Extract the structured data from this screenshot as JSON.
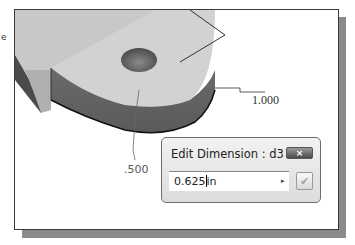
{
  "viewport": {
    "dimensions": [
      {
        "id": "d_1000",
        "value": "1.000"
      },
      {
        "id": "d_500",
        "value": ".500"
      }
    ],
    "edge_fragment": "e"
  },
  "edit_dimension_dialog": {
    "title": "Edit Dimension : d3",
    "value": "0.625",
    "unit": "in",
    "close_icon": "×",
    "arrow_icon": "▸",
    "accept_icon": "✔"
  }
}
